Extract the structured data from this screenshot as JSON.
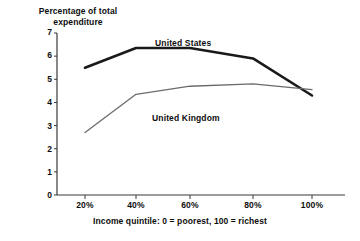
{
  "chart_data": {
    "type": "line",
    "title": "",
    "ylabel": "Percentage of total\nexpenditure",
    "xlabel": "Income quintile: 0 = poorest, 100 = richest",
    "x": [
      20,
      40,
      60,
      80,
      100
    ],
    "xtick_labels": [
      "20%",
      "40%",
      "60%",
      "80%",
      "100%"
    ],
    "ytick_labels": [
      "0",
      "1",
      "2",
      "3",
      "4",
      "5",
      "6",
      "7"
    ],
    "ylim": [
      0,
      7
    ],
    "grid": false,
    "legend": "inline-labels",
    "series": [
      {
        "name": "United States",
        "color": "#1a1a1a",
        "width": 2.6,
        "values": [
          5.5,
          6.35,
          6.35,
          5.9,
          4.3
        ],
        "label_x": 155,
        "label_y": 38
      },
      {
        "name": "United Kingdom",
        "color": "#6b6b6b",
        "width": 1.3,
        "values": [
          2.7,
          4.35,
          4.7,
          4.8,
          4.55
        ],
        "label_x": 152,
        "label_y": 113
      }
    ]
  },
  "axes": {
    "axis_color": "#3a3a3a",
    "y_ticks": [
      {
        "label": "7",
        "top": 28
      },
      {
        "label": "6",
        "top": 51
      },
      {
        "label": "5",
        "top": 75
      },
      {
        "label": "4",
        "top": 98
      },
      {
        "label": "3",
        "top": 122
      },
      {
        "label": "2",
        "top": 145
      },
      {
        "label": "1",
        "top": 168
      },
      {
        "label": "0",
        "top": 191
      }
    ],
    "x_ticks": [
      {
        "label": "20%",
        "left": 63
      },
      {
        "label": "40%",
        "left": 114
      },
      {
        "label": "60%",
        "left": 168
      },
      {
        "label": "80%",
        "left": 231
      },
      {
        "label": "100%",
        "left": 290
      }
    ]
  }
}
